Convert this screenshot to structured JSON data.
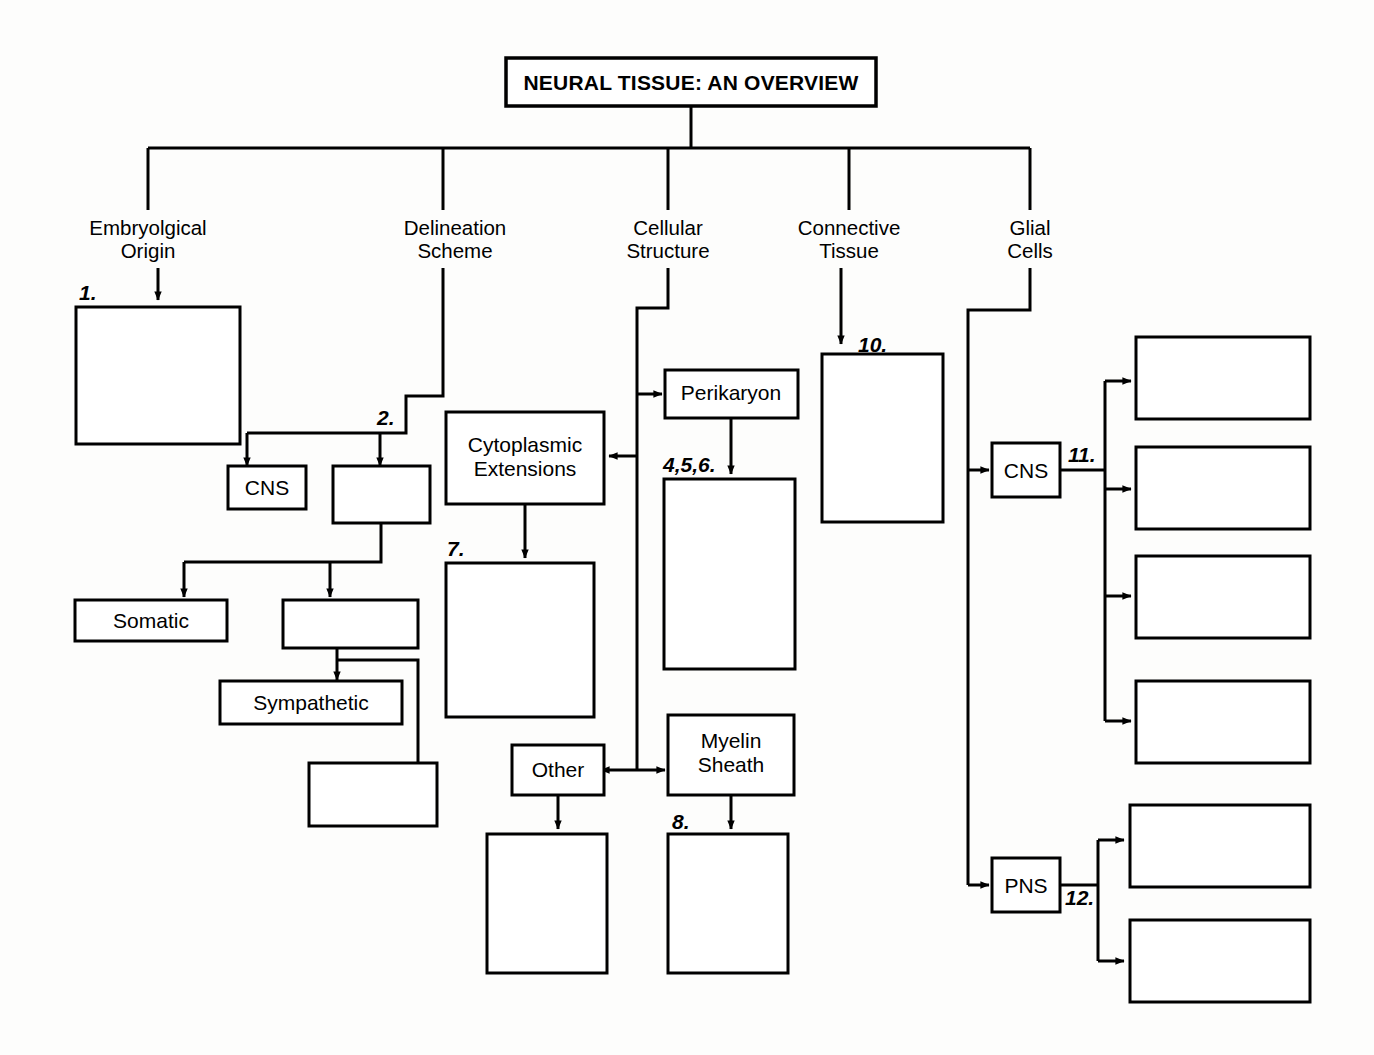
{
  "title": {
    "label": "NEURAL TISSUE: AN OVERVIEW"
  },
  "branches": [
    {
      "id": "embryolgical-origin",
      "line1": "Embryolgical",
      "line2": "Origin"
    },
    {
      "id": "delineation-scheme",
      "line1": "Delineation",
      "line2": "Scheme"
    },
    {
      "id": "cellular-structure",
      "line1": "Cellular",
      "line2": "Structure"
    },
    {
      "id": "connective-tissue",
      "line1": "Connective",
      "line2": "Tissue"
    },
    {
      "id": "glial-cells",
      "line1": "Glial",
      "line2": "Cells"
    }
  ],
  "labeled_boxes": [
    {
      "id": "cns-delineation",
      "label": "CNS"
    },
    {
      "id": "somatic",
      "label": "Somatic"
    },
    {
      "id": "sympathetic",
      "label": "Sympathetic"
    },
    {
      "id": "cytoplasmic-extensions",
      "line1": "Cytoplasmic",
      "line2": "Extensions"
    },
    {
      "id": "perikaryon",
      "label": "Perikaryon"
    },
    {
      "id": "other",
      "label": "Other"
    },
    {
      "id": "myelin-sheath",
      "line1": "Myelin",
      "line2": "Sheath"
    },
    {
      "id": "cns-glial",
      "label": "CNS"
    },
    {
      "id": "pns-glial",
      "label": "PNS"
    }
  ],
  "blank_boxes": [
    {
      "id": "blank-1",
      "number": "1."
    },
    {
      "id": "blank-2",
      "number": "2."
    },
    {
      "id": "blank-3",
      "number": ""
    },
    {
      "id": "blank-4",
      "number": ""
    },
    {
      "id": "blank-456",
      "number": "4,5,6."
    },
    {
      "id": "blank-7",
      "number": "7."
    },
    {
      "id": "blank-8",
      "number": "8."
    },
    {
      "id": "blank-9",
      "number": ""
    },
    {
      "id": "blank-10",
      "number": "10."
    },
    {
      "id": "blank-11a",
      "number": "11."
    },
    {
      "id": "blank-11b",
      "number": ""
    },
    {
      "id": "blank-11c",
      "number": ""
    },
    {
      "id": "blank-11d",
      "number": ""
    },
    {
      "id": "blank-12a",
      "number": "12."
    },
    {
      "id": "blank-12b",
      "number": ""
    }
  ],
  "numbers": {
    "n1": "1.",
    "n2": "2.",
    "n456": "4,5,6.",
    "n7": "7.",
    "n8": "8.",
    "n10": "10.",
    "n11": "11.",
    "n12": "12."
  },
  "colors": {
    "ink": "#000000",
    "paper": "#ffffff"
  }
}
